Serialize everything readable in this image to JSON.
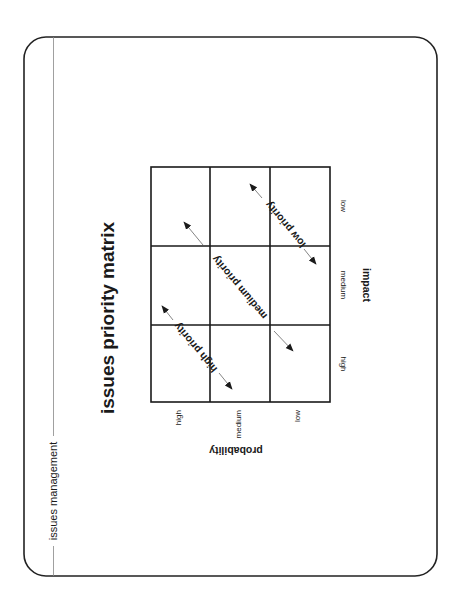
{
  "page": {
    "section_label": "issues management",
    "title": "issues priority matrix"
  },
  "matrix": {
    "rows": 3,
    "cols": 3,
    "impact_axis": {
      "label": "impact",
      "ticks": [
        "low",
        "medium",
        "high"
      ]
    },
    "probability_axis": {
      "label": "probability",
      "ticks": [
        "high",
        "medium",
        "low"
      ]
    },
    "priority_bands": [
      {
        "label": "low priority"
      },
      {
        "label": "medium priority"
      },
      {
        "label": "high priority"
      }
    ]
  },
  "colors": {
    "ink": "#1a1a1a",
    "frame": "#222222",
    "thin_line": "#888888",
    "background": "#ffffff"
  }
}
